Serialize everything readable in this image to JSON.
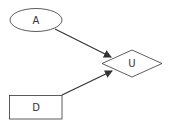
{
  "diagram": {
    "nodes": [
      {
        "id": "A",
        "label": "A",
        "shape": "ellipse"
      },
      {
        "id": "U",
        "label": "U",
        "shape": "diamond"
      },
      {
        "id": "D",
        "label": "D",
        "shape": "rectangle"
      }
    ],
    "edges": [
      {
        "from": "A",
        "to": "U"
      },
      {
        "from": "D",
        "to": "U"
      }
    ],
    "colors": {
      "stroke": "#333333",
      "fill": "#ffffff"
    }
  }
}
